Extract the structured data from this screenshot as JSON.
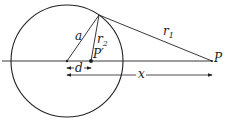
{
  "diagram": {
    "labels": {
      "a": "a",
      "r2": "r",
      "r2_sub": "2",
      "r1": "r",
      "r1_sub": "1",
      "p_prime": "P′",
      "p": "P",
      "d": "d",
      "x": "x"
    },
    "colors": {
      "stroke": "#222222",
      "background": "#ffffff"
    }
  }
}
